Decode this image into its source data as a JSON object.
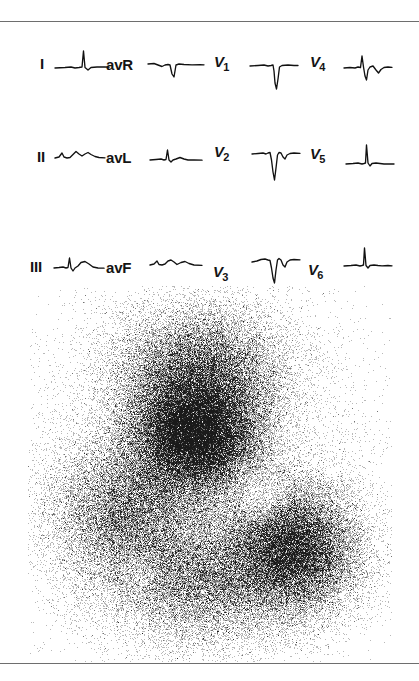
{
  "figure": {
    "kind": "medical-figure",
    "panels": [
      "ecg-12-lead",
      "radionuclide-scintigram"
    ],
    "background_color": "#ffffff",
    "rule_color": "#6e6e6e"
  },
  "ecg": {
    "name": "12-lead-ecg",
    "trace_color": "#111111",
    "label_color": "#141414",
    "columns": 4,
    "rows": 3,
    "leads": [
      {
        "id": "I",
        "label": "I",
        "subscript": "",
        "row": 0,
        "column": 0,
        "label_x": 40,
        "label_y": 34,
        "trace_x": 55,
        "trace_y": 24,
        "trace_w": 54,
        "trace_h": 36,
        "morphology": "small-r-wave-flat-baseline",
        "path": "M0,22 L10,21.5 L16,21 L20,22 L24,21.5 L27,21 L28.5,5 L30,21.5 L33,24 L36,21.5 L42,21 L50,21 L54,21.2"
      },
      {
        "id": "avR",
        "label": "avR",
        "subscript": "",
        "row": 0,
        "column": 1,
        "label_x": 106,
        "label_y": 35,
        "trace_x": 148,
        "trace_y": 32,
        "trace_w": 56,
        "trace_h": 32,
        "morphology": "negative-qrs-inverted-p",
        "path": "M0,10 L6,9.5 L10,11 L14,12.5 L17,11 L20,10.5 L22,11 L24,20 L26,23 L28,11 L31,10 L36,10.5 L44,10.8 L52,10.6 L56,10.8"
      },
      {
        "id": "V1",
        "label": "V",
        "subscript": "1",
        "row": 0,
        "column": 2,
        "label_x": 214,
        "label_y": 32,
        "trace_x": 250,
        "trace_y": 35,
        "trace_w": 48,
        "trace_h": 38,
        "morphology": "deep-qs-complex",
        "path": "M0,9 L8,8.5 L14,8 L18,9 L21,8.5 L23,8 L24,14 L25,26 L26.5,32 L28,22 L29.5,10 L32,8.5 L38,8 L44,8.5 L48,8.5"
      },
      {
        "id": "V4",
        "label": "V",
        "subscript": "4",
        "row": 0,
        "column": 3,
        "label_x": 310,
        "label_y": 32,
        "trace_x": 344,
        "trace_y": 30,
        "trace_w": 48,
        "trace_h": 40,
        "morphology": "biphasic-rs-complex",
        "path": "M0,16 L6,15.5 L11,16 L14,15 L16.5,15.5 L18,4 L19.5,15 L21,24 L22.5,28 L24,18 L26,15 L29,14 L32,18 L34.5,21 L37,17.5 L40,15.5 L44,15 L48,15.3"
      },
      {
        "id": "II",
        "label": "II",
        "subscript": "",
        "row": 1,
        "column": 0,
        "label_x": 37,
        "label_y": 127,
        "trace_x": 55,
        "trace_y": 118,
        "trace_w": 50,
        "trace_h": 32,
        "morphology": "low-amplitude-rsr-notched",
        "path": "M0,18 L4,17 L7,13 L9,17 L12,18 L15,17.5 L18,14.5 L21,11.5 L24,14 L27,16 L30,14 L33,12.5 L36,14.5 L40,16.5 L44,17.5 L50,17.8"
      },
      {
        "id": "avL",
        "label": "avL",
        "subscript": "",
        "row": 1,
        "column": 1,
        "label_x": 106,
        "label_y": 128,
        "trace_x": 150,
        "trace_y": 122,
        "trace_w": 52,
        "trace_h": 30,
        "morphology": "small-r-with-t-wave",
        "path": "M0,16 L6,15.5 L11,15 L14,16 L16,15.5 L17.5,6 L19,16 L21,18 L23,16 L26,15 L30,13.5 L34,15 L38,16 L44,16 L52,16.2"
      },
      {
        "id": "V2",
        "label": "V",
        "subscript": "2",
        "row": 1,
        "column": 2,
        "label_x": 214,
        "label_y": 122,
        "trace_x": 252,
        "trace_y": 122,
        "trace_w": 48,
        "trace_h": 42,
        "morphology": "deep-qs-with-terminal-positivity",
        "path": "M0,10 L6,9.5 L11,9 L14,10 L16,9 L18,8.5 L19.5,16 L21,28 L22.5,36 L24,24 L25.5,11 L27,8.5 L29,9 L31,13 L33,15 L35,11 L38,9.5 L42,9 L48,9.3"
      },
      {
        "id": "V5",
        "label": "V",
        "subscript": "5",
        "row": 1,
        "column": 3,
        "label_x": 310,
        "label_y": 124,
        "trace_x": 346,
        "trace_y": 118,
        "trace_w": 48,
        "trace_h": 38,
        "morphology": "tall-narrow-r-wave",
        "path": "M0,24 L7,23.5 L12,23 L16,24 L18,23.5 L19.5,23 L20.5,5 L22,23 L24,26 L26,23.5 L30,23 L34,23.5 L38,24 L44,23.8 L48,24"
      },
      {
        "id": "III",
        "label": "III",
        "subscript": "",
        "row": 2,
        "column": 0,
        "label_x": 30,
        "label_y": 237,
        "trace_x": 54,
        "trace_y": 228,
        "trace_w": 50,
        "trace_h": 32,
        "morphology": "qr-with-prominent-t-wave",
        "path": "M0,18 L5,17.5 L9,17 L12,18 L14,17.5 L15.5,8 L17,18 L19,21 L21,18 L24,16 L27,12.5 L31,11.5 L35,14 L39,17 L44,18 L50,18.2"
      },
      {
        "id": "avF",
        "label": "avF",
        "subscript": "",
        "row": 2,
        "column": 1,
        "label_x": 106,
        "label_y": 238,
        "trace_x": 150,
        "trace_y": 228,
        "trace_w": 52,
        "trace_h": 28,
        "morphology": "low-amplitude-notched-rs",
        "path": "M0,15 L4,14 L7,11 L9,14.5 L12,15 L15,14 L18,11 L21,10 L24,12 L27,14.5 L31,12.5 L35,11.5 L39,13.5 L44,15 L52,15.3"
      },
      {
        "id": "V3",
        "label": "V",
        "subscript": "3",
        "row": 2,
        "column": 2,
        "label_x": 213,
        "label_y": 242,
        "trace_x": 252,
        "trace_y": 228,
        "trace_w": 48,
        "trace_h": 40,
        "morphology": "deep-qs-with-rsr-notch",
        "path": "M0,12 L5,11 L9,9.5 L13,9 L16,10 L18,10.5 L19.5,18 L21,28 L22.5,33 L24,20 L25.5,10 L27,8.5 L29,10 L31,15 L33,17 L35,12 L38,10 L42,9.5 L48,9.8"
      },
      {
        "id": "V6",
        "label": "V",
        "subscript": "6",
        "row": 2,
        "column": 3,
        "label_x": 308,
        "label_y": 240,
        "trace_x": 344,
        "trace_y": 222,
        "trace_w": 48,
        "trace_h": 36,
        "morphology": "tall-narrow-r-wave",
        "path": "M0,22 L7,21.5 L12,21 L16,22 L18,21.5 L19.5,21 L20.5,4 L22,21.5 L24,24 L26,21.5 L30,21 L34,21.5 L38,21.8 L44,21.5 L48,21.8"
      }
    ]
  },
  "scintigram": {
    "name": "radionuclide-scintigram",
    "modality": "dot-matrix-scintigraphy",
    "dot_color": "#1a1a1a",
    "background_color": "#ffffff",
    "region_x": 28,
    "region_y": 286,
    "region_width": 364,
    "region_height": 376,
    "total_dots": 120000,
    "hot_spots": [
      {
        "name": "primary-dense-core",
        "cx": 0.46,
        "cy": 0.4,
        "rx": 0.17,
        "ry": 0.15,
        "weight": 1.0
      },
      {
        "name": "upper-activity-lobe",
        "cx": 0.47,
        "cy": 0.23,
        "rx": 0.22,
        "ry": 0.16,
        "weight": 0.55
      },
      {
        "name": "lower-right-lobe",
        "cx": 0.73,
        "cy": 0.7,
        "rx": 0.17,
        "ry": 0.16,
        "weight": 0.72
      },
      {
        "name": "left-diffuse-uptake",
        "cx": 0.27,
        "cy": 0.6,
        "rx": 0.2,
        "ry": 0.19,
        "weight": 0.45
      },
      {
        "name": "inferior-diffuse-uptake",
        "cx": 0.48,
        "cy": 0.78,
        "rx": 0.24,
        "ry": 0.16,
        "weight": 0.42
      },
      {
        "name": "background-field",
        "cx": 0.48,
        "cy": 0.52,
        "rx": 0.44,
        "ry": 0.46,
        "weight": 0.3
      }
    ],
    "cold_spots": [
      {
        "name": "photopenic-notch-right",
        "cx": 0.64,
        "cy": 0.56,
        "rx": 0.085,
        "ry": 0.075,
        "strength": 0.62
      },
      {
        "name": "photopenic-notch-left",
        "cx": 0.31,
        "cy": 0.76,
        "rx": 0.07,
        "ry": 0.06,
        "strength": 0.45
      }
    ]
  }
}
